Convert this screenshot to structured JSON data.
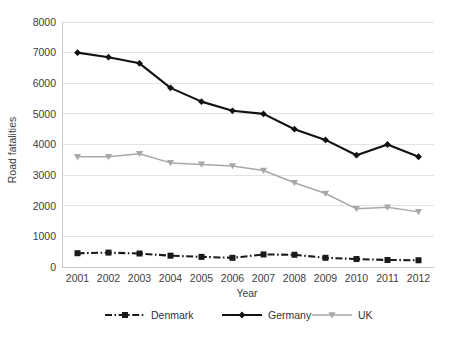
{
  "chart_data": {
    "type": "line",
    "title": "",
    "subtitle": "",
    "xlabel": "Year",
    "ylabel": "Road fatalities",
    "categories": [
      "2001",
      "2002",
      "2003",
      "2004",
      "2005",
      "2006",
      "2007",
      "2008",
      "2009",
      "2010",
      "2011",
      "2012"
    ],
    "x": [
      2001,
      2002,
      2003,
      2004,
      2005,
      2006,
      2007,
      2008,
      2009,
      2010,
      2011,
      2012
    ],
    "ylim": [
      0,
      8000
    ],
    "y_ticks": [
      0,
      1000,
      2000,
      3000,
      4000,
      5000,
      6000,
      7000,
      8000
    ],
    "y_tick_labels": [
      "0",
      "1000",
      "2000",
      "3000",
      "4000",
      "5000",
      "6000",
      "7000",
      "8000"
    ],
    "grid": true,
    "grid_axis": "y",
    "legend_position": "bottom",
    "series": [
      {
        "name": "Denmark",
        "values": [
          450,
          470,
          440,
          370,
          330,
          300,
          410,
          400,
          300,
          260,
          230,
          220
        ],
        "color": "#1a1a1a",
        "marker": "square",
        "line_style": "dash-dot"
      },
      {
        "name": "Germany",
        "values": [
          7000,
          6850,
          6650,
          5850,
          5400,
          5100,
          5000,
          4500,
          4150,
          3650,
          4000,
          3600
        ],
        "color": "#111111",
        "marker": "diamond",
        "line_style": "solid"
      },
      {
        "name": "UK",
        "values": [
          3600,
          3600,
          3700,
          3400,
          3350,
          3300,
          3150,
          2750,
          2400,
          1900,
          1950,
          1800
        ],
        "color": "#a8a8a8",
        "marker": "triangle-down",
        "line_style": "solid"
      }
    ]
  },
  "legend": {
    "entries": [
      {
        "label": "Denmark"
      },
      {
        "label": "Germany"
      },
      {
        "label": "UK"
      }
    ]
  },
  "colors": {
    "grid": "#e3e3e3",
    "axis": "#c9c9c9",
    "text": "#404040",
    "denmark": "#1a1a1a",
    "germany": "#111111",
    "uk": "#a8a8a8",
    "background": "#ffffff"
  }
}
